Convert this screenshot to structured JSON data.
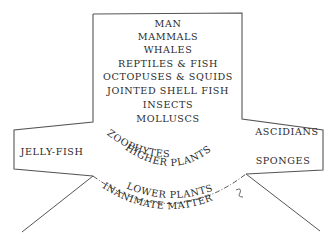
{
  "diagram": {
    "type": "hierarchy-of-life",
    "colors": {
      "ink": "#2a2a2a",
      "outline": "#555555",
      "background": "#ffffff"
    },
    "column": [
      "MAN",
      "MAMMALS",
      "WHALES",
      "REPTILES & FISH",
      "OCTOPUSES & SQUIDS",
      "JOINTED SHELL FISH",
      "INSECTS",
      "MOLLUSCS"
    ],
    "left_arm": "JELLY-FISH",
    "right_arm": {
      "upper": "ASCIDIANS",
      "lower": "SPONGES"
    },
    "curved": {
      "zoophytes": "ZOOPHYTES",
      "higher_plants": "HIGHER PLANTS",
      "lower_plants": "LOWER PLANTS",
      "inanimate": "INANIMATE MATTER"
    }
  }
}
